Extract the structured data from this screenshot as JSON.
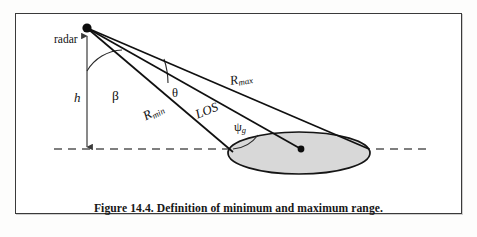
{
  "figure": {
    "caption": "Figure 14.4. Definition of minimum and maximum range.",
    "border_color": "#3a3a3a",
    "background": "#ffffff",
    "page_background": "#fdfdfc"
  },
  "labels": {
    "radar": "radar",
    "height": "h",
    "beta": "β",
    "theta": "θ",
    "r_max_base": "R",
    "r_max_sub": "max",
    "r_min_base": "R",
    "r_min_sub": "min",
    "los": "LOS",
    "psi_base": "ψ",
    "psi_sub": "g"
  },
  "geometry": {
    "radar_apex": {
      "x": 86,
      "y": 27
    },
    "ground_point_below_radar": {
      "x": 86,
      "y": 148
    },
    "footprint_center": {
      "x": 300,
      "y": 148
    },
    "footprint_near_edge": {
      "x": 232,
      "y": 151
    },
    "footprint_far_edge": {
      "x": 368,
      "y": 148
    },
    "ellipse": {
      "cx": 298,
      "cy": 152,
      "rx": 71,
      "ry": 21,
      "fill": "#d6d6d6",
      "stroke": "#1a1a1a"
    },
    "ground_line": {
      "x1": 53,
      "y1": 148,
      "x2": 431,
      "y2": 148,
      "style": "dashed",
      "color": "#4a4a4a"
    },
    "ray_max": {
      "from": "radar_apex",
      "to": "footprint_far_edge"
    },
    "ray_los": {
      "from": "radar_apex",
      "to": "footprint_center"
    },
    "ray_min": {
      "from": "radar_apex",
      "to": "footprint_near_edge"
    },
    "angle_beta_arc": "between vertical height line and R_min ray",
    "angle_theta_arc": "between R_max ray and R_min ray",
    "angle_psi_g_arc": "between ground line and R_min ray at footprint near edge"
  }
}
